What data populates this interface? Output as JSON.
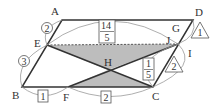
{
  "diagram": {
    "points": {
      "A": "A",
      "B": "B",
      "C": "C",
      "D": "D",
      "E": "E",
      "F": "F",
      "G": "G",
      "H": "H",
      "I": "I",
      "J": "J"
    },
    "ratios": {
      "AE": "2",
      "EB": "3",
      "BF": "1",
      "FC": "2",
      "top_frac_num": "14",
      "top_frac_den": "5",
      "hc_frac_num": "1",
      "hc_frac_den": "5",
      "tri_top": "1",
      "tri_bottom": "2"
    },
    "colors": {
      "line": "#333333",
      "shade": "#bdbdbd",
      "arc": "#888888"
    }
  }
}
